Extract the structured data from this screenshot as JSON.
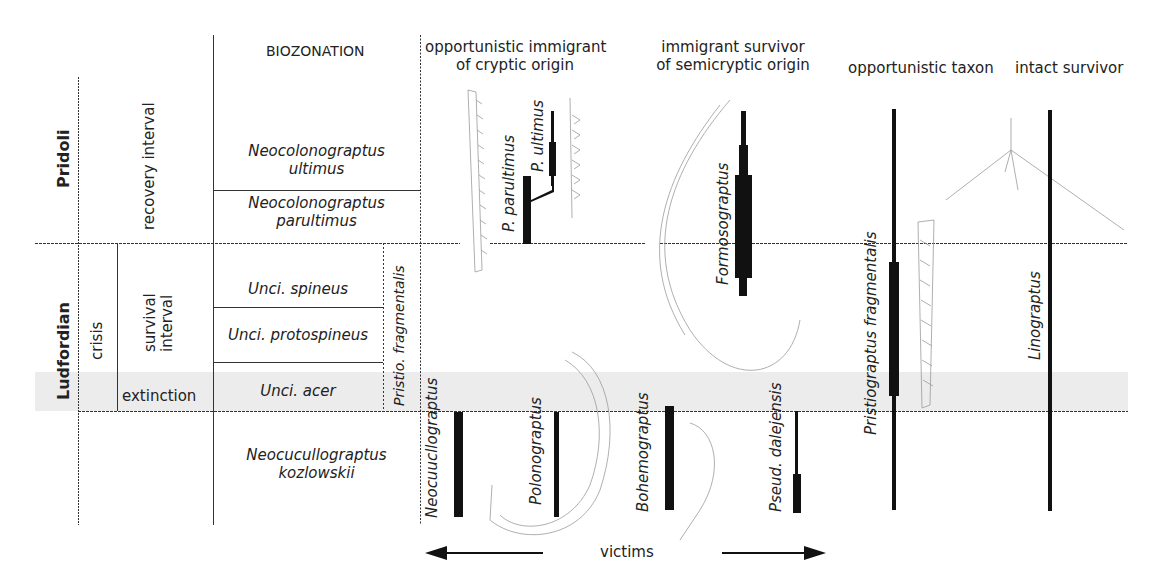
{
  "header": {
    "biozonation": "BIOZONATION",
    "categories": [
      {
        "line1": "opportunistic immigrant",
        "line2": "of cryptic origin"
      },
      {
        "line1": "immigrant survivor",
        "line2": "of semicryptic origin"
      },
      {
        "line1": "opportunistic taxon",
        "line2": ""
      },
      {
        "line1": "intact survivor",
        "line2": ""
      }
    ]
  },
  "stages": {
    "pridoli": "Pridoli",
    "ludfordian": "Ludfordian"
  },
  "intervals": {
    "recovery": "recovery interval",
    "crisis": "crisis",
    "survival_line1": "survival",
    "survival_line2": "interval",
    "extinction": "extinction"
  },
  "biozones": {
    "ultimus_1": "Neocolonograptus",
    "ultimus_2": "ultimus",
    "parultimus_1": "Neocolonograptus",
    "parultimus_2": "parultimus",
    "spineus": "Unci. spineus",
    "protospineus": "Unci. protospineus",
    "acer": "Unci. acer",
    "kozlowskii_1": "Neocucullograptus",
    "kozlowskii_2": "kozlowskii",
    "pristio_side": "Pristio. fragmentalis"
  },
  "taxa": {
    "p_parultimus": "P. parultimus",
    "p_ultimus": "P. ultimus",
    "formosograptus": "Formosograptus",
    "pristiograptus_fragmentalis": "Pristiograptus fragmentalis",
    "linograptus": "Linograptus",
    "neocucullograptus": "Neocuucllograptus",
    "polonograptus": "Polonograptus",
    "bohemograptus": "Bohemograptus",
    "pseud_dalejensis": "Pseud. dalejensis"
  },
  "footer": {
    "victims": "victims"
  },
  "colors": {
    "line": "#333333",
    "bar": "#111111",
    "band": "#ececec",
    "sketch": "#9a9a9a"
  }
}
